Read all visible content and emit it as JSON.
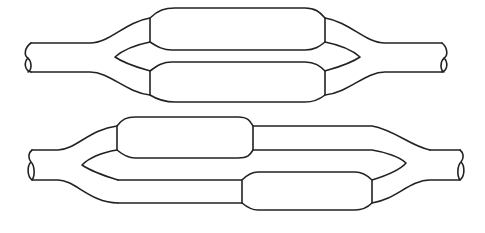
{
  "diagram": {
    "type": "line-drawing",
    "figures": [
      {
        "id": "top",
        "label": "parallel-branches",
        "branches": 2,
        "chambers": 2
      },
      {
        "id": "bottom",
        "label": "staggered-branches",
        "branches": 2,
        "chambers": 2
      }
    ],
    "stroke_color": "#222222",
    "background": "#ffffff"
  }
}
